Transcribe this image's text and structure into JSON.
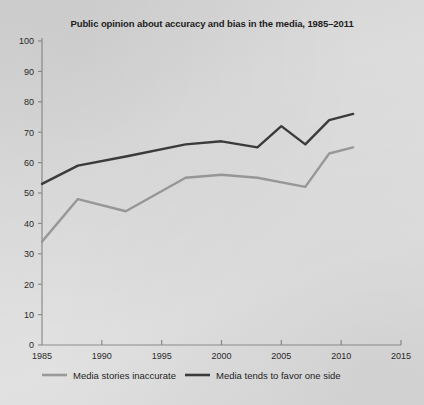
{
  "chart_data": {
    "type": "line",
    "title": "Public opinion about accuracy and bias in the media, 1985–2011",
    "xlabel": "",
    "ylabel": "",
    "xlim": [
      1985,
      2015
    ],
    "ylim": [
      0,
      100
    ],
    "grid": false,
    "legend_position": "bottom",
    "xticks": [
      1985,
      1990,
      1995,
      2000,
      2005,
      2010,
      2015
    ],
    "xtick_labels": [
      "1985",
      "1990",
      "1995",
      "2000",
      "2005",
      "2010",
      "2015"
    ],
    "yticks": [
      0,
      10,
      20,
      30,
      40,
      50,
      60,
      70,
      80,
      90,
      100
    ],
    "ytick_labels": [
      "0",
      "10",
      "20",
      "30",
      "40",
      "50",
      "60",
      "70",
      "80",
      "90",
      "100"
    ],
    "series": [
      {
        "name": "Media stories inaccurate",
        "color": "#9a9a9a",
        "x": [
          1985,
          1988,
          1992,
          1997,
          2000,
          2003,
          2007,
          2009,
          2011
        ],
        "values": [
          34,
          48,
          44,
          55,
          56,
          55,
          52,
          63,
          65
        ]
      },
      {
        "name": "Media tends to favor one side",
        "color": "#3c3c3c",
        "x": [
          1985,
          1988,
          1992,
          1997,
          2000,
          2003,
          2005,
          2007,
          2009,
          2011
        ],
        "values": [
          53,
          59,
          62,
          66,
          67,
          65,
          72,
          66,
          74,
          76
        ]
      }
    ]
  },
  "legend": {
    "items": [
      {
        "label": "Media stories inaccurate",
        "color": "#9a9a9a"
      },
      {
        "label": "Media tends to favor one side",
        "color": "#3c3c3c"
      }
    ]
  },
  "colors": {
    "background": "#dcdcdc",
    "axis": "#8d8d8d",
    "text": "#1d1d1d",
    "series_light": "#9a9a9a",
    "series_dark": "#3c3c3c"
  }
}
